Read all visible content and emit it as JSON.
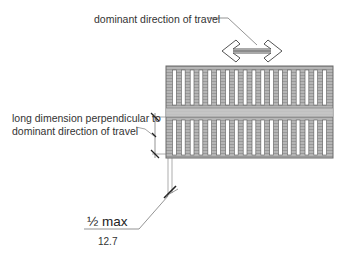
{
  "diagram": {
    "title_callout": "dominant direction of travel",
    "side_callout_line1": "long dimension perpendicular to",
    "side_callout_line2": "dominant direction of travel",
    "dimension_imperial": "½ max",
    "dimension_metric": "12.7",
    "grate": {
      "rows": 2,
      "slots_per_row": 18,
      "frame_color": "#8a8a8a",
      "fill_color": "#b8b8b8",
      "slot_color": "#ffffff"
    },
    "arrow": {
      "type": "double-headed",
      "orientation": "horizontal"
    },
    "line_color": "#555555"
  }
}
